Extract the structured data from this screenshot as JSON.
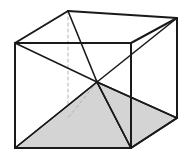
{
  "figure": {
    "name": "cube-with-inscribed-pyramid",
    "canvas": {
      "width": 195,
      "height": 160,
      "background": "#ffffff"
    },
    "colors": {
      "stroke_visible": "#1a1a1a",
      "stroke_hidden": "#b3b3b3",
      "shade_fill": "#d4d4d4",
      "shade_stroke": "#1a1a1a",
      "background": "#ffffff"
    },
    "stroke_widths": {
      "outline": 2.0,
      "diagonal": 1.6,
      "hidden": 1.0
    },
    "dash_pattern": "3 3",
    "vertices": {
      "top_front_left": {
        "label": "A",
        "x": 15,
        "y": 43,
        "hidden": false
      },
      "top_front_right": {
        "label": "B",
        "x": 131,
        "y": 43,
        "hidden": false
      },
      "top_back_right": {
        "label": "C",
        "x": 177,
        "y": 18,
        "hidden": false
      },
      "top_back_left": {
        "label": "D",
        "x": 68,
        "y": 11,
        "hidden": false
      },
      "bottom_front_left": {
        "label": "E",
        "x": 15,
        "y": 148,
        "hidden": false
      },
      "bottom_front_right": {
        "label": "F",
        "x": 131,
        "y": 148,
        "hidden": false
      },
      "bottom_back_right": {
        "label": "G",
        "x": 177,
        "y": 118,
        "hidden": false
      },
      "bottom_back_left": {
        "label": "H",
        "x": 68,
        "y": 118,
        "hidden": true
      },
      "center": {
        "label": "O",
        "x": 97,
        "y": 82,
        "hidden": false
      }
    },
    "edges_visible": [
      {
        "name": "top-front-edge",
        "from": "top_front_left",
        "to": "top_front_right"
      },
      {
        "name": "top-right-edge",
        "from": "top_front_right",
        "to": "top_back_right"
      },
      {
        "name": "top-back-edge",
        "from": "top_back_right",
        "to": "top_back_left"
      },
      {
        "name": "top-left-edge",
        "from": "top_back_left",
        "to": "top_front_left"
      },
      {
        "name": "front-left-vertical",
        "from": "top_front_left",
        "to": "bottom_front_left"
      },
      {
        "name": "front-right-vertical",
        "from": "top_front_right",
        "to": "bottom_front_right"
      },
      {
        "name": "back-right-vertical",
        "from": "top_back_right",
        "to": "bottom_back_right"
      },
      {
        "name": "bottom-front-edge",
        "from": "bottom_front_left",
        "to": "bottom_front_right"
      },
      {
        "name": "bottom-right-edge",
        "from": "bottom_front_right",
        "to": "bottom_back_right"
      }
    ],
    "edges_hidden": [
      {
        "name": "back-left-vertical",
        "from": "top_back_left",
        "to": "bottom_back_left"
      },
      {
        "name": "bottom-back-left-edge",
        "from": "bottom_back_left",
        "to": "bottom_front_left"
      },
      {
        "name": "bottom-back-right-edge",
        "from": "bottom_back_left",
        "to": "bottom_back_right"
      }
    ],
    "diagonals_visible": [
      {
        "name": "diagonal-top-front-left-to-center",
        "from": "top_front_left",
        "to": "center"
      },
      {
        "name": "diagonal-top-back-left-to-center",
        "from": "top_back_left",
        "to": "center"
      },
      {
        "name": "diagonal-top-back-right-to-center",
        "from": "top_back_right",
        "to": "center"
      },
      {
        "name": "diagonal-center-to-bottom-front-left",
        "from": "center",
        "to": "bottom_front_left"
      },
      {
        "name": "diagonal-center-to-bottom-front-right",
        "from": "center",
        "to": "bottom_front_right"
      },
      {
        "name": "diagonal-center-to-bottom-back-right",
        "from": "center",
        "to": "bottom_back_right"
      }
    ],
    "diagonals_hidden": [
      {
        "name": "diagonal-center-to-bottom-back-left",
        "from": "center",
        "to": "bottom_back_left"
      }
    ],
    "shaded_pyramid": {
      "name": "shaded-pyramid",
      "apex": "center",
      "base": [
        "bottom_front_left",
        "bottom_front_right",
        "bottom_back_right",
        "bottom_back_left"
      ],
      "visible_faces": [
        {
          "name": "pyramid-face-front",
          "points": [
            "center",
            "bottom_front_left",
            "bottom_front_right"
          ]
        },
        {
          "name": "pyramid-face-right",
          "points": [
            "center",
            "bottom_front_right",
            "bottom_back_right"
          ]
        }
      ]
    }
  }
}
